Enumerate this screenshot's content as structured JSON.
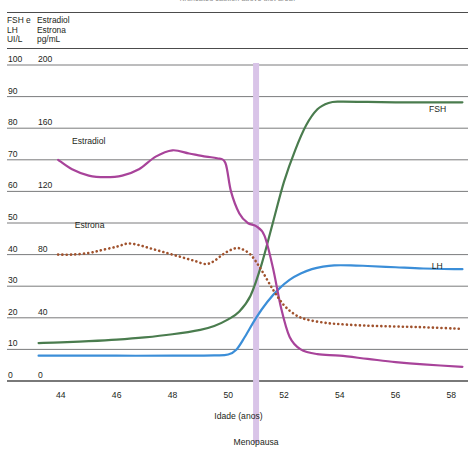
{
  "figure": {
    "cut_title": "(truncated caption above plot area)",
    "header": {
      "left_column_lines": [
        "FSH e",
        "LH",
        "UI/L"
      ],
      "right_column_lines": [
        "Estradiol",
        "Estrona",
        "pg/mL"
      ]
    }
  },
  "chart_data": {
    "type": "line",
    "title": "",
    "xlabel": "Idade (anos)",
    "ylabel": "",
    "xlim": [
      43,
      58.6
    ],
    "xticks": [
      44,
      46,
      48,
      50,
      52,
      54,
      56,
      58
    ],
    "xtick_labels": [
      "44",
      "46",
      "48",
      "50",
      "52",
      "54",
      "56",
      "58"
    ],
    "grid": true,
    "legend_position": "inline-annotations",
    "axes": [
      {
        "name": "left",
        "unit": "UI/L",
        "applies_to": [
          "FSH",
          "LH"
        ],
        "ylim": [
          0,
          100
        ],
        "yticks": [
          0,
          10,
          20,
          30,
          40,
          50,
          60,
          70,
          80,
          90,
          100
        ],
        "ytick_labels": [
          "0",
          "10",
          "20",
          "30",
          "40",
          "50",
          "60",
          "70",
          "80",
          "90",
          "100"
        ]
      },
      {
        "name": "secondary",
        "unit": "pg/mL",
        "applies_to": [
          "Estradiol",
          "Estrona"
        ],
        "ylim": [
          0,
          200
        ],
        "yticks": [
          0,
          40,
          80,
          120,
          160,
          200
        ],
        "ytick_labels": [
          "0",
          "40",
          "80",
          "120",
          "160",
          "200"
        ]
      }
    ],
    "annotations": [
      {
        "text": "Menopausa",
        "x": 51,
        "kind": "vertical-band",
        "color": "#d9c4e8"
      },
      {
        "text": "FSH",
        "x": 57.2,
        "y": 85,
        "kind": "series-label"
      },
      {
        "text": "LH",
        "x": 57.3,
        "y": 35.5,
        "kind": "series-label"
      },
      {
        "text": "Estradiol",
        "x": 44.4,
        "y": 150,
        "kind": "series-label"
      },
      {
        "text": "Estrona",
        "x": 44.5,
        "y": 97,
        "kind": "series-label"
      }
    ],
    "series": [
      {
        "name": "FSH",
        "axis": "left",
        "color": "#4a7c4e",
        "style": "solid",
        "x": [
          43.2,
          44,
          45,
          46,
          47,
          48,
          49,
          49.5,
          50,
          50.4,
          50.8,
          51.2,
          51.6,
          52,
          52.4,
          52.8,
          53.2,
          53.6,
          54,
          55,
          56,
          57,
          58.4
        ],
        "values": [
          12,
          12.2,
          12.6,
          13.1,
          13.8,
          14.8,
          16.2,
          17.4,
          19.5,
          22,
          27,
          37,
          50,
          63,
          73,
          81,
          86,
          88,
          88.4,
          88.3,
          88.2,
          88.2,
          88.2
        ]
      },
      {
        "name": "LH",
        "axis": "left",
        "color": "#3b8ed8",
        "style": "solid",
        "x": [
          43.2,
          44,
          46,
          48,
          49.5,
          50,
          50.3,
          50.6,
          51,
          51.4,
          51.8,
          52.2,
          52.6,
          53,
          53.4,
          53.8,
          54.4,
          55,
          56,
          57,
          58.4
        ],
        "values": [
          8,
          8,
          8,
          8,
          8.1,
          8.4,
          10,
          14,
          20,
          25,
          29,
          32,
          34,
          35.4,
          36.2,
          36.6,
          36.6,
          36.4,
          36,
          35.6,
          35.4
        ]
      },
      {
        "name": "Estradiol",
        "axis": "secondary",
        "color": "#a8439a",
        "style": "solid",
        "x": [
          43.9,
          44.4,
          45,
          45.6,
          46.2,
          46.8,
          47.4,
          48,
          48.6,
          49.2,
          49.6,
          49.9,
          50.1,
          50.4,
          50.7,
          51,
          51.3,
          51.6,
          51.9,
          52.2,
          52.6,
          53.2,
          54,
          55,
          56,
          57,
          58.4
        ],
        "values": [
          140,
          134,
          130,
          129,
          130,
          134,
          142,
          146,
          144,
          142,
          141,
          138,
          120,
          106,
          100,
          98,
          92,
          72,
          46,
          28,
          20,
          17,
          16,
          14,
          12,
          10.5,
          9
        ]
      },
      {
        "name": "Estrona",
        "axis": "secondary",
        "color": "#a0522d",
        "style": "dotted",
        "x": [
          43.9,
          44.4,
          45,
          45.5,
          46,
          46.4,
          46.8,
          47.2,
          47.6,
          48,
          48.4,
          48.8,
          49.2,
          49.5,
          49.8,
          50.1,
          50.4,
          50.8,
          51.2,
          51.6,
          52,
          52.4,
          52.8,
          53.4,
          54,
          55,
          56,
          57,
          58.4
        ],
        "values": [
          80,
          80,
          81,
          83,
          85,
          87,
          86,
          84,
          82,
          80,
          78,
          76,
          74,
          76,
          80,
          83,
          84,
          80,
          70,
          58,
          48,
          42,
          39,
          37,
          36,
          35,
          34.5,
          34,
          33
        ]
      }
    ]
  }
}
